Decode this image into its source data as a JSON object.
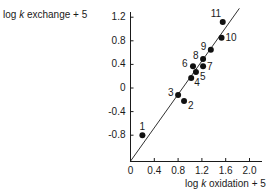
{
  "chart_data": {
    "type": "scatter",
    "title": "",
    "xlabel": "log k oxidation + 5",
    "ylabel": "log k exchange + 5",
    "xlim": [
      0,
      2.2
    ],
    "ylim": [
      -1.24,
      1.3
    ],
    "x_ticks": [
      "0",
      "0.4",
      "0.8",
      "1.2",
      "1.6",
      "2.0"
    ],
    "y_ticks": [
      "1.2",
      "0.8",
      "0.4",
      "0",
      "-0.4",
      "-0.8"
    ],
    "grid": false,
    "legend": null,
    "points": [
      {
        "label": "1",
        "x": 0.2,
        "y": -0.8
      },
      {
        "label": "2",
        "x": 0.9,
        "y": -0.22
      },
      {
        "label": "3",
        "x": 0.8,
        "y": -0.12
      },
      {
        "label": "4",
        "x": 1.02,
        "y": 0.17
      },
      {
        "label": "5",
        "x": 1.1,
        "y": 0.27
      },
      {
        "label": "6",
        "x": 1.05,
        "y": 0.37
      },
      {
        "label": "7",
        "x": 1.22,
        "y": 0.37
      },
      {
        "label": "8",
        "x": 1.22,
        "y": 0.49
      },
      {
        "label": "9",
        "x": 1.35,
        "y": 0.65
      },
      {
        "label": "10",
        "x": 1.53,
        "y": 0.85
      },
      {
        "label": "11",
        "x": 1.55,
        "y": 1.12
      }
    ],
    "reference_line": {
      "x1": 0,
      "y1": -1.24,
      "x2": 1.83,
      "y2": 1.35,
      "note": "line through origin of axes"
    }
  },
  "axes": {
    "ylabel_prefix": "log ",
    "ylabel_k": "k",
    "ylabel_suffix": " exchange + 5",
    "xlabel_prefix": "log ",
    "xlabel_k": "k",
    "xlabel_suffix": " oxidation + 5"
  }
}
